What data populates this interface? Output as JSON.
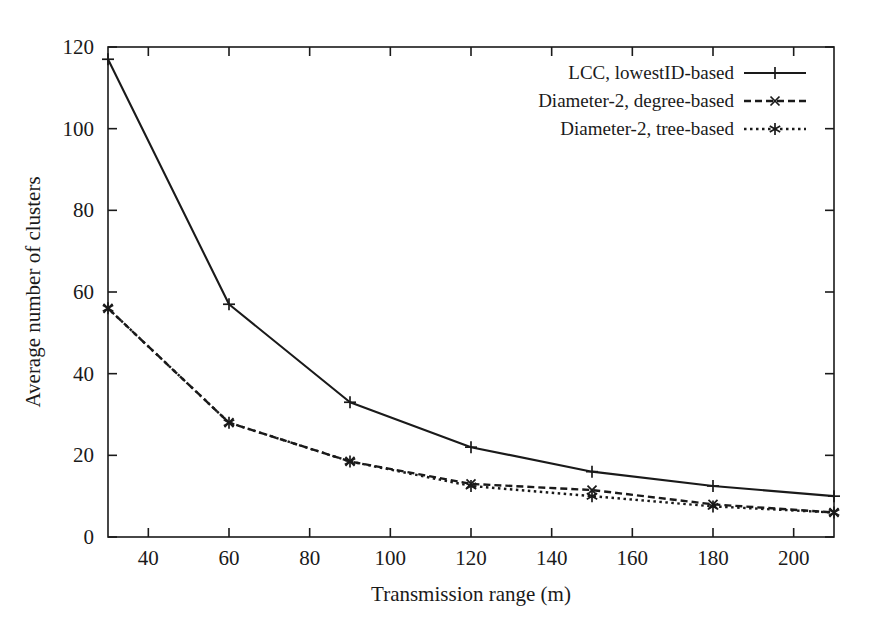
{
  "figure": {
    "background_color": "#ffffff",
    "ink_color": "#1a1a1a"
  },
  "chart_data": {
    "type": "line",
    "title": "",
    "subtitle": "",
    "xlabel": "Transmission range (m)",
    "ylabel": "Average number of clusters",
    "xlim": [
      30,
      210
    ],
    "ylim": [
      0,
      120
    ],
    "xticks": [
      40,
      60,
      80,
      100,
      120,
      140,
      160,
      180,
      200
    ],
    "yticks": [
      0,
      20,
      40,
      60,
      80,
      100,
      120
    ],
    "xticklabels": [
      "40",
      "60",
      "80",
      "100",
      "120",
      "140",
      "160",
      "180",
      "200"
    ],
    "yticklabels": [
      "0",
      "20",
      "40",
      "60",
      "80",
      "100",
      "120"
    ],
    "grid": false,
    "legend_position": "top-right",
    "x": [
      30,
      60,
      90,
      120,
      150,
      180,
      210
    ],
    "series": [
      {
        "name": "LCC, lowestID-based",
        "values": [
          117,
          57,
          33,
          22,
          16,
          12.5,
          10
        ],
        "linestyle": "solid",
        "marker": "plus",
        "color": "#1a1a1a"
      },
      {
        "name": "Diameter-2, degree-based",
        "values": [
          56,
          28,
          18.5,
          13,
          11.5,
          8,
          6
        ],
        "linestyle": "dashed",
        "marker": "cross",
        "color": "#1a1a1a"
      },
      {
        "name": "Diameter-2, tree-based",
        "values": [
          56,
          28,
          18.5,
          12.5,
          10,
          7.5,
          6
        ],
        "linestyle": "dotted",
        "marker": "asterisk",
        "color": "#1a1a1a"
      }
    ]
  },
  "legend": {
    "entries": [
      {
        "label": "LCC, lowestID-based"
      },
      {
        "label": "Diameter-2, degree-based"
      },
      {
        "label": "Diameter-2, tree-based"
      }
    ]
  },
  "axes": {
    "x_axis_title": "Transmission range (m)",
    "y_axis_title": "Average number of clusters"
  }
}
